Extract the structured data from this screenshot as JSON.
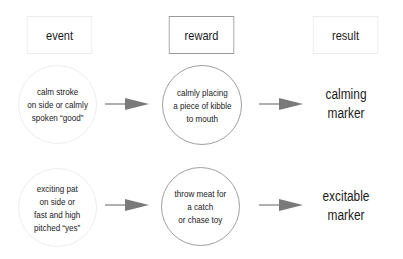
{
  "headers": {
    "event": "event",
    "reward": "reward",
    "result": "result"
  },
  "rows": [
    {
      "event": "calm stroke\non side or calmly\nspoken “good”",
      "reward": "calmly placing\na piece of kibble\nto mouth",
      "result": "calming\nmarker"
    },
    {
      "event": "exciting pat\non side or\nfast and high\npitched “yes”",
      "reward": "throw meat for\na catch\nor chase toy",
      "result": "excitable\nmarker"
    }
  ],
  "colors": {
    "arrow": "#7a7a7a",
    "text": "#1a1a1a",
    "light_border": "#ebebeb",
    "dark_border": "#9a9a9a"
  },
  "icons": {
    "arrow": "right-arrow"
  }
}
